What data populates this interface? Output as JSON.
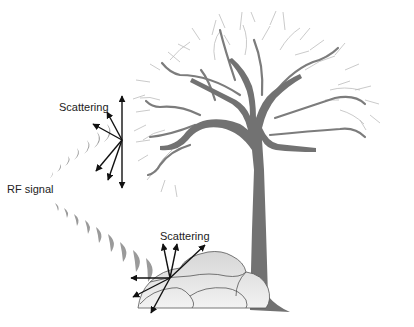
{
  "diagram": {
    "labels": {
      "scattering_top": "Scattering",
      "rf_signal": "RF signal",
      "scattering_bottom": "Scattering"
    },
    "colors": {
      "trunk": "#707070",
      "branches": "#8a8a8a",
      "twigs": "#b8b8b8",
      "rock_fill": "#e4e4e4",
      "rock_stroke": "#555555",
      "arrows": "#111111",
      "wave": "#9a9a9a"
    }
  }
}
